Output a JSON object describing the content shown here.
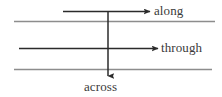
{
  "diagram": {
    "title": "",
    "background_color": "#ffffff",
    "boundary_line_color": "#8d8d8d",
    "arrow_color": "#2b2b2b",
    "label_color": "#3a3a3a",
    "boundaries": [
      {
        "name": "upper-boundary",
        "y": 21,
        "x_start": 14,
        "x_end": 215
      },
      {
        "name": "lower-boundary",
        "y": 69,
        "x_start": 14,
        "x_end": 212
      }
    ],
    "arrows": [
      {
        "id": "along",
        "label": "along",
        "direction": "horizontal-right",
        "x_start": 63,
        "x_end": 152,
        "y": 11
      },
      {
        "id": "through",
        "label": "through",
        "direction": "horizontal-right",
        "x_start": 19,
        "x_end": 160,
        "y": 48
      },
      {
        "id": "across",
        "label": "across",
        "direction": "vertical-down",
        "x": 108,
        "y_start": 12,
        "y_end": 78
      }
    ],
    "labels": {
      "along": "along",
      "through": "through",
      "across": "across"
    }
  }
}
